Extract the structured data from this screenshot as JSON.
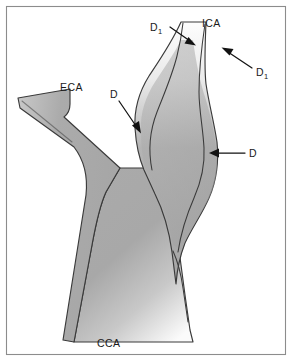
{
  "figure": {
    "background_color": "#ffffff",
    "border_color": "#8c8c8c",
    "vessel_fill_light": "#e9e9e9",
    "vessel_fill_mid": "#a9a9a9",
    "vessel_outline_color": "#3a3a3a",
    "annotation_color": "#121212"
  },
  "labels": {
    "ica": "ICA",
    "eca": "ECA",
    "cca": "CCA",
    "d_left": "D",
    "d_right": "D",
    "d1_base": "D",
    "d1_subscript": "1"
  },
  "annotations": [
    {
      "id": "d1-upper-left",
      "text": "D",
      "subscript": "1",
      "label_x": 150,
      "label_y": 31,
      "leader_start_x": 170,
      "leader_start_y": 27,
      "leader_end_x": 194,
      "leader_end_y": 44,
      "arrow_direction": "down-right"
    },
    {
      "id": "d1-upper-right",
      "text": "D",
      "subscript": "1",
      "label_x": 256,
      "label_y": 76,
      "leader_start_x": 252,
      "leader_start_y": 68,
      "leader_end_x": 223,
      "leader_end_y": 49,
      "arrow_direction": "up-left"
    },
    {
      "id": "d-left",
      "text": "D",
      "subscript": "",
      "label_x": 110,
      "label_y": 98,
      "leader_start_x": 119,
      "leader_start_y": 101,
      "leader_end_x": 140,
      "leader_end_y": 131,
      "arrow_direction": "down-right"
    },
    {
      "id": "d-right",
      "text": "D",
      "subscript": "",
      "label_x": 249,
      "label_y": 157,
      "leader_start_x": 245,
      "leader_start_y": 153,
      "leader_end_x": 210,
      "leader_end_y": 153,
      "arrow_direction": "left"
    }
  ],
  "vessel_labels": [
    {
      "id": "ica-label",
      "text": "ICA",
      "x": 202,
      "y": 27
    },
    {
      "id": "eca-label",
      "text": "ECA",
      "x": 60,
      "y": 91
    },
    {
      "id": "cca-label",
      "text": "CCA",
      "x": 97,
      "y": 347
    }
  ]
}
